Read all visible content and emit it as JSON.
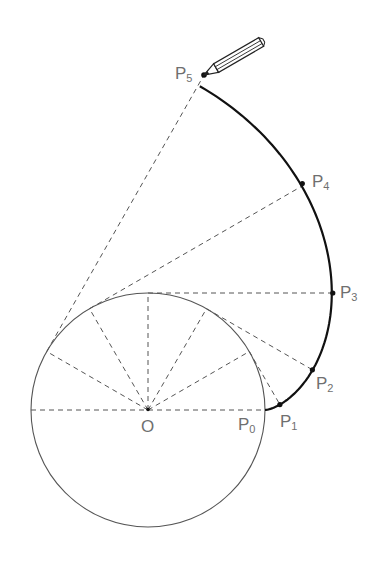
{
  "diagram": {
    "type": "involute-of-circle",
    "center": {
      "label": "O",
      "x": 148,
      "y": 410
    },
    "radius": 117,
    "step_degrees": 30,
    "points": [
      {
        "label": "P",
        "sub": "0",
        "theta": 0
      },
      {
        "label": "P",
        "sub": "1",
        "theta": 30
      },
      {
        "label": "P",
        "sub": "2",
        "theta": 60
      },
      {
        "label": "P",
        "sub": "3",
        "theta": 90
      },
      {
        "label": "P",
        "sub": "4",
        "theta": 120
      },
      {
        "label": "P",
        "sub": "5",
        "theta": 150
      }
    ],
    "labels": {
      "O": "O",
      "P0": "P",
      "P0_sub": "0",
      "P1": "P",
      "P1_sub": "1",
      "P2": "P",
      "P2_sub": "2",
      "P3": "P",
      "P3_sub": "3",
      "P4": "P",
      "P4_sub": "4",
      "P5": "P",
      "P5_sub": "5"
    },
    "pencil": {
      "icon": "pencil-icon",
      "at": "P5"
    },
    "colors": {
      "curve": "#111111",
      "dash": "#555555",
      "label": "#6f6f6f"
    }
  }
}
